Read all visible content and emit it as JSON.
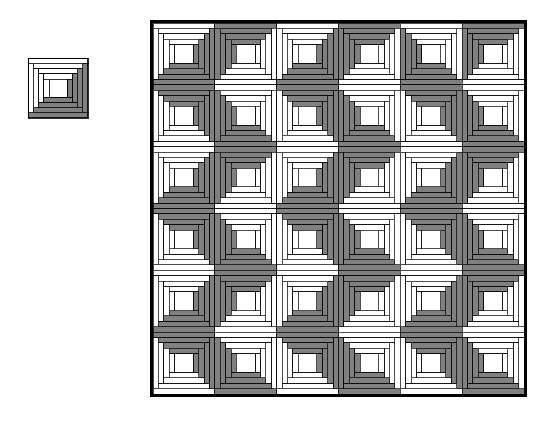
{
  "figure": {
    "kind": "log-cabin-quilt-diagram",
    "background_color": "#ffffff",
    "outline_color": "#000000",
    "light_fabric_color": "#ffffff",
    "dark_fabric_color": "#808080",
    "seam_line_color": "#000000",
    "unit_block": {
      "label": "single log cabin block",
      "x": 28,
      "y": 58,
      "size": 60,
      "rotation_deg": 0,
      "logs": 4,
      "center_square_fraction": 0.3,
      "dark_sides": "right-bottom",
      "light_sides": "left-top"
    },
    "quilt": {
      "label": "log cabin quilt top",
      "x": 150,
      "y": 20,
      "size": 377,
      "border_width": 3,
      "rows": 6,
      "cols": 6,
      "block_size": 62.5,
      "logs_per_block": 4,
      "orientation_codes": "0=dark right+bottom, 1=dark bottom+left, 2=dark left+top, 3=dark top+right",
      "orientation_grid": [
        [
          0,
          2,
          0,
          2,
          1,
          2
        ],
        [
          3,
          1,
          3,
          1,
          3,
          1
        ],
        [
          0,
          2,
          0,
          2,
          0,
          2
        ],
        [
          3,
          1,
          3,
          1,
          3,
          1
        ],
        [
          0,
          2,
          0,
          2,
          0,
          2
        ],
        [
          3,
          1,
          3,
          1,
          3,
          1
        ]
      ]
    }
  }
}
